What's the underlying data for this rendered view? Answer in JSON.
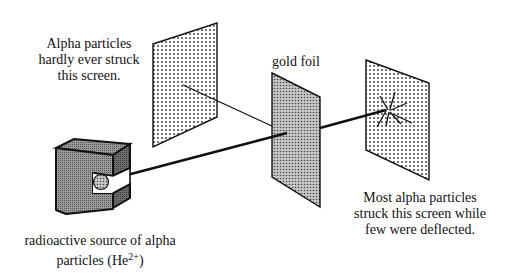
{
  "diagram": {
    "labels": {
      "left_screen_note": [
        "Alpha particles",
        "hardly ever struck",
        "this screen."
      ],
      "gold_foil": "gold foil",
      "right_screen_note": [
        "Most alpha particles",
        "struck this screen while",
        "few were deflected."
      ],
      "source_line1": "radioactive source of alpha",
      "source_line2_prefix": "particles (He",
      "source_charge": "2+",
      "source_line2_suffix": ")"
    },
    "components": [
      {
        "id": "radioactive-source",
        "shape": "C-shaped lead box"
      },
      {
        "id": "alpha-beam",
        "shape": "thick line"
      },
      {
        "id": "gold-foil",
        "shape": "dense-dotted panel"
      },
      {
        "id": "back-scatter-screen",
        "shape": "dotted panel"
      },
      {
        "id": "detector-screen",
        "shape": "dotted panel with deflection rays"
      }
    ],
    "colors": {
      "stroke": "#111111",
      "box_fill": "#7a7a7a",
      "panel_fill": "#ffffff"
    }
  }
}
